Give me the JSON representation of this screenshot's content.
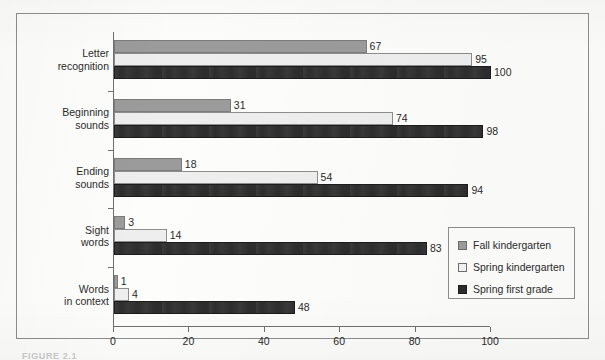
{
  "figure": {
    "frame_visible": true,
    "caption_partial": "FIGURE 2.1"
  },
  "legend": {
    "position": "inside-lower-right",
    "items": [
      {
        "label": "Fall kindergarten",
        "color": "#9b9b9b"
      },
      {
        "label": "Spring kindergarten",
        "color": "#f3f3f3"
      },
      {
        "label": "Spring first grade",
        "color": "#2d2d2d"
      }
    ]
  },
  "axis": {
    "value_ticks": [
      "0",
      "20",
      "40",
      "60",
      "80",
      "100"
    ],
    "category_labels": [
      {
        "line1": "Letter",
        "line2": "recognition"
      },
      {
        "line1": "Beginning",
        "line2": "sounds"
      },
      {
        "line1": "Ending",
        "line2": "sounds"
      },
      {
        "line1": "Sight",
        "line2": "words"
      },
      {
        "line1": "Words",
        "line2": "in context"
      }
    ]
  },
  "chart_data": {
    "type": "bar",
    "orientation": "horizontal",
    "title": "",
    "subtitle": "",
    "xlabel": "",
    "ylabel": "",
    "xlim": [
      0,
      100
    ],
    "xticks": [
      0,
      20,
      40,
      60,
      80,
      100
    ],
    "grid": false,
    "legend_position": "lower right (inside plot)",
    "categories": [
      "Letter recognition",
      "Beginning sounds",
      "Ending sounds",
      "Sight words",
      "Words in context"
    ],
    "series": [
      {
        "name": "Fall kindergarten",
        "color": "#9b9b9b",
        "values": [
          67,
          31,
          18,
          3,
          1
        ]
      },
      {
        "name": "Spring kindergarten",
        "color": "#f3f3f3",
        "values": [
          95,
          74,
          54,
          14,
          4
        ]
      },
      {
        "name": "Spring first grade",
        "color": "#2d2d2d",
        "values": [
          100,
          98,
          94,
          83,
          48
        ]
      }
    ],
    "data_labels": [
      {
        "category": "Letter recognition",
        "Fall kindergarten": "67",
        "Spring kindergarten": "95",
        "Spring first grade": "100"
      },
      {
        "category": "Beginning sounds",
        "Fall kindergarten": "31",
        "Spring kindergarten": "74",
        "Spring first grade": "98"
      },
      {
        "category": "Ending sounds",
        "Fall kindergarten": "18",
        "Spring kindergarten": "54",
        "Spring first grade": "94"
      },
      {
        "category": "Sight words",
        "Fall kindergarten": "3",
        "Spring kindergarten": "14",
        "Spring first grade": "83"
      },
      {
        "category": "Words in context",
        "Fall kindergarten": "1",
        "Spring kindergarten": "4",
        "Spring first grade": "48"
      }
    ]
  }
}
